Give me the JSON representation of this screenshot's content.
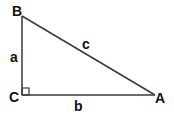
{
  "diagram": {
    "title": "",
    "type": "right-triangle",
    "vertices": {
      "A": {
        "label": "A"
      },
      "B": {
        "label": "B"
      },
      "C": {
        "label": "C"
      }
    },
    "sides": {
      "a": {
        "label": "a",
        "between": [
          "B",
          "C"
        ]
      },
      "b": {
        "label": "b",
        "between": [
          "C",
          "A"
        ]
      },
      "c": {
        "label": "c",
        "between": [
          "A",
          "B"
        ]
      }
    },
    "right_angle_at": "C",
    "colors": {
      "stroke": "#3a3a3a",
      "text": "#111111",
      "background": "#ffffff"
    }
  }
}
